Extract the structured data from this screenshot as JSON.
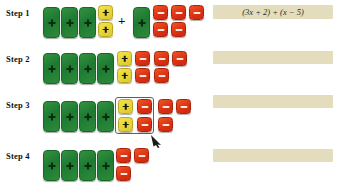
{
  "page": {
    "background": "#ffffff",
    "colors": {
      "x_tile_green": "#2f8a3a",
      "positive_unit_yellow": "#ddc92c",
      "negative_unit_red": "#da2f12",
      "strip_beige": "#e3dcbd",
      "box_outline": "#5a5f6e",
      "text": "#111111"
    }
  },
  "steps": [
    {
      "label": "Step 1",
      "groups": [
        {
          "kind": "x-tiles",
          "count": 3
        },
        {
          "kind": "positive-units",
          "count": 2,
          "rows": [
            1,
            1
          ]
        },
        {
          "kind": "operator",
          "symbol": "+"
        },
        {
          "kind": "x-tiles",
          "count": 1
        },
        {
          "kind": "negative-units",
          "count": 5,
          "rows": [
            3,
            2
          ]
        }
      ],
      "strip": {
        "text": "(3x + 2) + (x − 5)",
        "has_text": true
      }
    },
    {
      "label": "Step 2",
      "groups": [
        {
          "kind": "x-tiles",
          "count": 4
        },
        {
          "kind": "positive-units",
          "count": 2,
          "rows": [
            1,
            1
          ]
        },
        {
          "kind": "negative-units",
          "count": 5,
          "rows": [
            3,
            2
          ]
        }
      ],
      "strip": {
        "text": "",
        "has_text": false
      }
    },
    {
      "label": "Step 3",
      "groups": [
        {
          "kind": "x-tiles",
          "count": 4
        },
        {
          "kind": "zero-pairs-boxed",
          "positive_count": 2,
          "negative_count": 2
        },
        {
          "kind": "negative-units",
          "count": 3,
          "rows": [
            2,
            1
          ]
        }
      ],
      "strip": {
        "text": "",
        "has_text": false
      },
      "annotation": {
        "type": "pointer-arrow",
        "target": "zero-pair-box"
      }
    },
    {
      "label": "Step 4",
      "groups": [
        {
          "kind": "x-tiles",
          "count": 4
        },
        {
          "kind": "negative-units",
          "count": 3,
          "rows": [
            2,
            1
          ]
        }
      ],
      "strip": {
        "text": "",
        "has_text": false
      }
    }
  ],
  "icons": {
    "plus_glyph": "+",
    "minus_glyph": "−"
  }
}
